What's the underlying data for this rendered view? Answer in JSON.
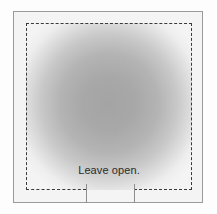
{
  "diagram": {
    "kind": "flap-opening-instruction-panel",
    "caption": "Leave open.",
    "colors": {
      "page_background": "#fdfdfd",
      "outer_frame_border": "#9a9a9a",
      "panel_background": "#f4f4f4",
      "dashed_line": "#3a3a3a",
      "tick_mark": "#8e8e8e",
      "caption_text": "#2b2b2b",
      "gradient_center": "#a4a4a4",
      "gradient_edge": "#f4f4f4"
    },
    "outer_frame": {
      "label": "outer solid rectangle border"
    },
    "dashed_rectangle": {
      "label": "dashed fold boundary",
      "bottom_gap_label": "open segment of bottom dashed edge"
    },
    "shaded_area": {
      "label": "shaded panel interior"
    },
    "tick_marks": [
      {
        "label": "left fold tick"
      },
      {
        "label": "right fold tick"
      }
    ]
  }
}
